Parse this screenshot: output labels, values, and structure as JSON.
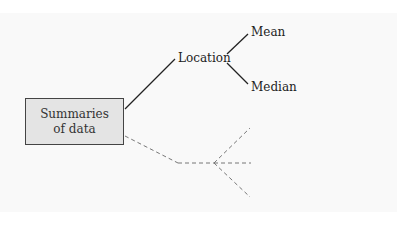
{
  "diagram": {
    "root": {
      "line1": "Summaries",
      "line2": "of data"
    },
    "branches": [
      {
        "label": "Location",
        "style": "solid",
        "children": [
          {
            "label": "Mean"
          },
          {
            "label": "Median"
          }
        ]
      },
      {
        "label": "",
        "style": "dashed",
        "children": [
          {
            "label": ""
          },
          {
            "label": ""
          },
          {
            "label": ""
          }
        ]
      }
    ],
    "colors": {
      "background": "#f9f9f9",
      "root_fill": "#e4e4e4",
      "solid_line": "#222222",
      "dashed_line": "#777777"
    }
  }
}
